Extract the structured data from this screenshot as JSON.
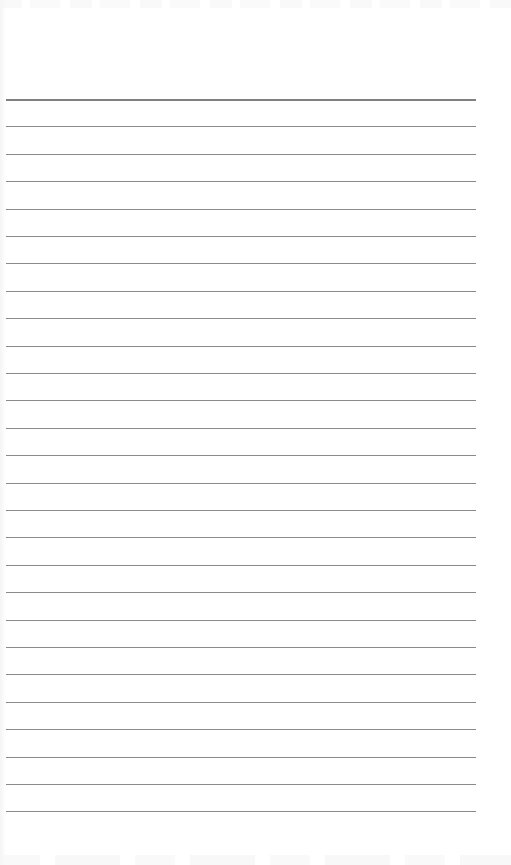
{
  "page": {
    "type": "blank lined paper",
    "line_color": "#8a8a8a",
    "header_line_color": "#808080",
    "background_color": "#ffffff",
    "line_count": 27,
    "first_line_y": 99,
    "line_spacing_px": 27.4,
    "content": []
  }
}
